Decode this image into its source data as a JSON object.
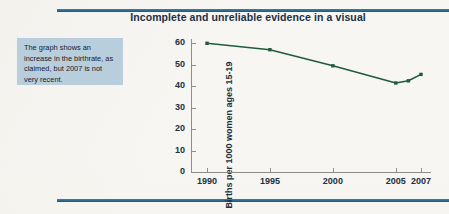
{
  "page": {
    "background_color": "#f7f6f3",
    "rule_color": "#2c6a92"
  },
  "title": "Incomplete and unreliable evidence in a visual",
  "callout": {
    "text": "The graph shows an increase in the birthrate, as claimed, but 2007 is not very recent.",
    "background_color": "#b8cedc"
  },
  "chart_data": {
    "type": "line",
    "title": "Incomplete and unreliable evidence in a visual",
    "xlabel": "",
    "ylabel": "Births per 1000 women ages 15-19",
    "x": [
      1990,
      1995,
      2000,
      2005,
      2006,
      2007
    ],
    "values": [
      60,
      57,
      49.5,
      41.5,
      42.5,
      45.5
    ],
    "series": [
      {
        "name": "Births per 1000 women ages 15-19",
        "color": "#1f5c3a",
        "values": [
          60,
          57,
          49.5,
          41.5,
          42.5,
          45.5
        ]
      }
    ],
    "xlim": [
      1989,
      2008
    ],
    "ylim": [
      0,
      62
    ],
    "xtick_labels": [
      "1990",
      "1995",
      "2000",
      "2005",
      "2007"
    ],
    "xtick_values": [
      1990,
      1995,
      2000,
      2005,
      2007
    ],
    "ytick_labels": [
      "0",
      "10",
      "20",
      "30",
      "40",
      "50",
      "60"
    ],
    "ytick_values": [
      0,
      10,
      20,
      30,
      40,
      50,
      60
    ],
    "grid": false,
    "legend": "none",
    "marker": "filled-square",
    "line_color": "#1f5c3a",
    "axis_color": "#8d8d8d"
  }
}
